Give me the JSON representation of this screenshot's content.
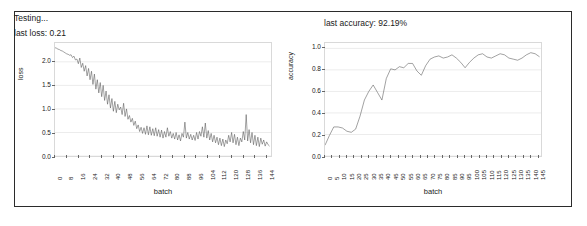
{
  "status": {
    "line1": "Testing...",
    "line2": "last loss: 0.21"
  },
  "accuracy_header": "last accuracy: 92.19%",
  "colors": {
    "line": "#555555",
    "grid": "#ececec",
    "frame": "#d9d9d9",
    "panel_border": "#2b2b2b",
    "text": "#1a1a1a"
  },
  "chart_data": [
    {
      "type": "line",
      "id": "loss-chart",
      "title": "",
      "xlabel": "batch",
      "ylabel": "loss",
      "xlim": [
        0,
        148
      ],
      "ylim": [
        0.0,
        2.4
      ],
      "grid": true,
      "legend": "none",
      "yticks": [
        "0.0",
        "0.5",
        "1.0",
        "1.5",
        "2.0"
      ],
      "ytick_values": [
        0.0,
        0.5,
        1.0,
        1.5,
        2.0
      ],
      "xticks": [
        "0",
        "8",
        "16",
        "24",
        "32",
        "40",
        "48",
        "56",
        "64",
        "72",
        "80",
        "88",
        "96",
        "104",
        "112",
        "120",
        "128",
        "136",
        "144"
      ],
      "xtick_values": [
        0,
        8,
        16,
        24,
        32,
        40,
        48,
        56,
        64,
        72,
        80,
        88,
        96,
        104,
        112,
        120,
        128,
        136,
        144
      ],
      "x": [
        0,
        1,
        2,
        3,
        4,
        5,
        6,
        7,
        8,
        9,
        10,
        11,
        12,
        13,
        14,
        15,
        16,
        17,
        18,
        19,
        20,
        21,
        22,
        23,
        24,
        25,
        26,
        27,
        28,
        29,
        30,
        31,
        32,
        33,
        34,
        35,
        36,
        37,
        38,
        39,
        40,
        41,
        42,
        43,
        44,
        45,
        46,
        47,
        48,
        49,
        50,
        51,
        52,
        53,
        54,
        55,
        56,
        57,
        58,
        59,
        60,
        61,
        62,
        63,
        64,
        65,
        66,
        67,
        68,
        69,
        70,
        71,
        72,
        73,
        74,
        75,
        76,
        77,
        78,
        79,
        80,
        81,
        82,
        83,
        84,
        85,
        86,
        87,
        88,
        89,
        90,
        91,
        92,
        93,
        94,
        95,
        96,
        97,
        98,
        99,
        100,
        101,
        102,
        103,
        104,
        105,
        106,
        107,
        108,
        109,
        110,
        111,
        112,
        113,
        114,
        115,
        116,
        117,
        118,
        119,
        120,
        121,
        122,
        123,
        124,
        125,
        126,
        127,
        128,
        129,
        130,
        131,
        132,
        133,
        134,
        135,
        136,
        137,
        138,
        139,
        140,
        141,
        142,
        143,
        144,
        145,
        146,
        147
      ],
      "values": [
        2.3,
        2.29,
        2.27,
        2.26,
        2.24,
        2.23,
        2.21,
        2.19,
        2.17,
        2.16,
        2.14,
        2.15,
        2.09,
        2.12,
        2.04,
        2.06,
        1.96,
        2.08,
        1.88,
        1.97,
        1.8,
        1.92,
        1.7,
        1.86,
        1.62,
        1.8,
        1.52,
        1.74,
        1.42,
        1.62,
        1.34,
        1.56,
        1.26,
        1.5,
        1.18,
        1.38,
        1.1,
        1.3,
        1.02,
        1.22,
        0.95,
        1.16,
        0.92,
        1.1,
        0.98,
        1.04,
        0.88,
        1.12,
        0.84,
        1.0,
        0.78,
        0.86,
        0.72,
        0.8,
        0.65,
        0.74,
        0.58,
        0.66,
        0.52,
        0.61,
        0.48,
        0.6,
        0.46,
        0.64,
        0.45,
        0.62,
        0.44,
        0.58,
        0.43,
        0.6,
        0.42,
        0.56,
        0.4,
        0.55,
        0.38,
        0.52,
        0.4,
        0.6,
        0.42,
        0.52,
        0.38,
        0.48,
        0.36,
        0.5,
        0.34,
        0.45,
        0.32,
        0.48,
        0.4,
        0.72,
        0.38,
        0.5,
        0.36,
        0.46,
        0.34,
        0.44,
        0.33,
        0.5,
        0.36,
        0.52,
        0.42,
        0.62,
        0.4,
        0.7,
        0.38,
        0.54,
        0.34,
        0.48,
        0.3,
        0.44,
        0.28,
        0.4,
        0.24,
        0.38,
        0.22,
        0.36,
        0.2,
        0.34,
        0.26,
        0.44,
        0.3,
        0.5,
        0.28,
        0.46,
        0.24,
        0.4,
        0.22,
        0.38,
        0.3,
        0.52,
        0.34,
        0.88,
        0.32,
        0.56,
        0.28,
        0.5,
        0.24,
        0.44,
        0.22,
        0.4,
        0.2,
        0.38,
        0.25,
        0.34,
        0.21,
        0.3,
        0.24,
        0.21
      ]
    },
    {
      "type": "line",
      "id": "accuracy-chart",
      "title": "",
      "xlabel": "batch",
      "ylabel": "accuracy",
      "xlim": [
        0,
        148
      ],
      "ylim": [
        0.0,
        1.05
      ],
      "grid": true,
      "legend": "none",
      "yticks": [
        "0.0",
        "0.2",
        "0.4",
        "0.6",
        "0.8",
        "1.0"
      ],
      "ytick_values": [
        0.0,
        0.2,
        0.4,
        0.6,
        0.8,
        1.0
      ],
      "xticks": [
        "0",
        "5",
        "10",
        "15",
        "20",
        "25",
        "30",
        "35",
        "40",
        "45",
        "50",
        "55",
        "60",
        "65",
        "70",
        "75",
        "80",
        "85",
        "90",
        "95",
        "100",
        "105",
        "110",
        "115",
        "120",
        "125",
        "130",
        "135",
        "140",
        "145"
      ],
      "xtick_values": [
        0,
        5,
        10,
        15,
        20,
        25,
        30,
        35,
        40,
        45,
        50,
        55,
        60,
        65,
        70,
        75,
        80,
        85,
        90,
        95,
        100,
        105,
        110,
        115,
        120,
        125,
        130,
        135,
        140,
        145
      ],
      "x": [
        0,
        3,
        6,
        9,
        12,
        15,
        18,
        21,
        24,
        27,
        30,
        33,
        36,
        39,
        42,
        45,
        48,
        51,
        54,
        57,
        60,
        63,
        66,
        69,
        72,
        75,
        78,
        81,
        84,
        87,
        90,
        93,
        96,
        99,
        102,
        105,
        108,
        111,
        114,
        117,
        120,
        123,
        126,
        129,
        132,
        135,
        138,
        141,
        144,
        147
      ],
      "values": [
        0.1,
        0.19,
        0.27,
        0.27,
        0.26,
        0.23,
        0.22,
        0.25,
        0.37,
        0.52,
        0.6,
        0.66,
        0.59,
        0.52,
        0.72,
        0.81,
        0.8,
        0.83,
        0.82,
        0.86,
        0.86,
        0.79,
        0.75,
        0.84,
        0.9,
        0.92,
        0.93,
        0.91,
        0.92,
        0.94,
        0.91,
        0.87,
        0.82,
        0.87,
        0.91,
        0.94,
        0.95,
        0.92,
        0.91,
        0.93,
        0.95,
        0.94,
        0.91,
        0.9,
        0.89,
        0.91,
        0.94,
        0.96,
        0.95,
        0.9219
      ]
    }
  ]
}
